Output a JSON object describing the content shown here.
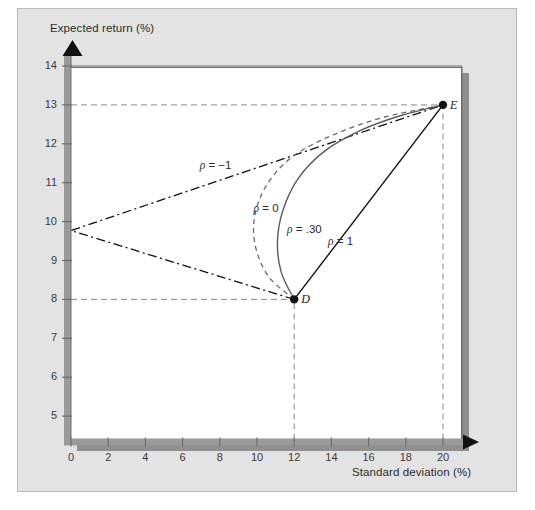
{
  "figure": {
    "background_color": "#e3e3e3",
    "plot_background_color": "#ffffff",
    "axis_color": "#6d6d6d",
    "shadow_color": "#8f8f8f"
  },
  "chart_data": {
    "type": "line",
    "title": "",
    "xlabel": "Standard deviation (%)",
    "ylabel": "Expected return (%)",
    "xlim": [
      0,
      21
    ],
    "ylim": [
      4.4,
      14.4
    ],
    "xticks": [
      "0",
      "2",
      "4",
      "6",
      "8",
      "10",
      "12",
      "14",
      "16",
      "18",
      "20"
    ],
    "xtick_values": [
      0,
      2,
      4,
      6,
      8,
      10,
      12,
      14,
      16,
      18,
      20
    ],
    "yticks": [
      "5",
      "6",
      "7",
      "8",
      "9",
      "10",
      "11",
      "12",
      "13",
      "14"
    ],
    "ytick_values": [
      5,
      6,
      7,
      8,
      9,
      10,
      11,
      12,
      13,
      14
    ],
    "grid": false,
    "legend_position": "inline-annotations",
    "points": [
      {
        "name": "D",
        "label": "D",
        "x": 12,
        "y": 8
      },
      {
        "name": "E",
        "label": "E",
        "x": 20,
        "y": 13
      }
    ],
    "reference_lines": [
      {
        "name": "E-horizontal",
        "type": "dashed",
        "orientation": "horizontal",
        "y": 13,
        "from_x": 0,
        "to_x": 20
      },
      {
        "name": "D-horizontal",
        "type": "dashed",
        "orientation": "horizontal",
        "y": 8,
        "from_x": 0,
        "to_x": 12
      },
      {
        "name": "E-vertical",
        "type": "dashed",
        "orientation": "vertical",
        "x": 20,
        "from_y": 4.4,
        "to_y": 13
      },
      {
        "name": "D-vertical",
        "type": "dashed",
        "orientation": "vertical",
        "x": 12,
        "from_y": 4.4,
        "to_y": 8
      }
    ],
    "series": [
      {
        "name": "rho-minus-1",
        "label": "ρ = −1",
        "style": "dash-dot",
        "color": "#111111",
        "label_x": 8.1,
        "label_y": 11.4,
        "points": [
          [
            12,
            8
          ],
          [
            0,
            9.77
          ],
          [
            20,
            13
          ]
        ]
      },
      {
        "name": "rho-0",
        "label": "ρ = 0",
        "style": "dashed",
        "color": "#6a6a6a",
        "label_x": 11.0,
        "label_y": 10.3,
        "points": [
          [
            12,
            8
          ],
          [
            10.6,
            8.6
          ],
          [
            9.9,
            9.4
          ],
          [
            9.9,
            10.2
          ],
          [
            10.6,
            11.0
          ],
          [
            12.0,
            11.7
          ],
          [
            14.2,
            12.25
          ],
          [
            16.8,
            12.68
          ],
          [
            20,
            13
          ]
        ]
      },
      {
        "name": "rho-point-30",
        "label": "ρ = .30",
        "style": "solid",
        "color": "#5a5a5a",
        "label_x": 12.8,
        "label_y": 9.75,
        "points": [
          [
            12,
            8
          ],
          [
            11.3,
            8.7
          ],
          [
            11.1,
            9.5
          ],
          [
            11.4,
            10.3
          ],
          [
            12.2,
            11.1
          ],
          [
            13.6,
            11.8
          ],
          [
            15.6,
            12.35
          ],
          [
            17.7,
            12.72
          ],
          [
            20,
            13
          ]
        ]
      },
      {
        "name": "rho-1",
        "label": "ρ = 1",
        "style": "solid",
        "color": "#111111",
        "label_x": 15.0,
        "label_y": 9.45,
        "points": [
          [
            12,
            8
          ],
          [
            20,
            13
          ]
        ]
      }
    ],
    "annotations": [
      {
        "name": "point-label-D",
        "text": "D",
        "x": 12,
        "y": 8
      },
      {
        "name": "point-label-E",
        "text": "E",
        "x": 20,
        "y": 13
      }
    ]
  }
}
